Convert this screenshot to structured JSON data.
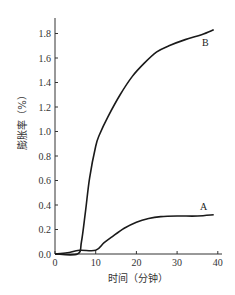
{
  "chart_data": {
    "type": "line",
    "title": "",
    "xlabel": "时间（分钟）",
    "ylabel": "膨胀率（%）",
    "xlim": [
      0,
      40
    ],
    "ylim": [
      0.0,
      1.9
    ],
    "x_ticks": [
      0,
      10,
      20,
      30,
      40
    ],
    "x_tick_labels": [
      "0",
      "10",
      "20",
      "30",
      "40"
    ],
    "y_ticks": [
      0.0,
      0.2,
      0.4,
      0.6,
      0.8,
      1.0,
      1.2,
      1.4,
      1.6,
      1.8
    ],
    "y_tick_labels": [
      "0.0",
      "0.2",
      "0.4",
      "0.6",
      "0.8",
      "1.0",
      "1.2",
      "1.4",
      "1.6",
      "1.8"
    ],
    "grid": false,
    "legend": "inline labels at curve ends",
    "series": [
      {
        "name": "A",
        "x": [
          0,
          3,
          6,
          10,
          12,
          14,
          17,
          20,
          23,
          26,
          30,
          35,
          39
        ],
        "y": [
          0.0,
          0.01,
          0.03,
          0.03,
          0.09,
          0.14,
          0.21,
          0.26,
          0.29,
          0.305,
          0.31,
          0.31,
          0.32
        ]
      },
      {
        "name": "B",
        "x": [
          0,
          5.5,
          6.5,
          7.5,
          8.5,
          10,
          11,
          13,
          16,
          19,
          22,
          25,
          28,
          32,
          36,
          39
        ],
        "y": [
          0.0,
          0.0,
          0.1,
          0.35,
          0.62,
          0.88,
          0.98,
          1.12,
          1.3,
          1.45,
          1.56,
          1.65,
          1.7,
          1.75,
          1.79,
          1.83
        ]
      }
    ]
  },
  "labels": {
    "series_a": "A",
    "series_b": "B",
    "xlabel": "时间（分钟）",
    "ylabel": "膨胀率（%）"
  }
}
